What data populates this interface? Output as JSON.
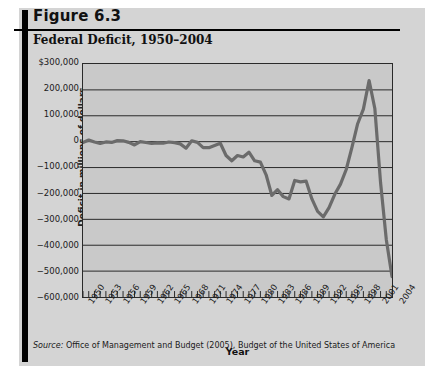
{
  "figure": {
    "label": "Figure 6.3",
    "title": "Federal Deficit, 1950–2004",
    "source_prefix": "Source:",
    "source_text": " Office of Management and Budget (2005), Budget of the United States of America"
  },
  "colors": {
    "panel_background": "#d4d4d4",
    "plot_background": "#c9c9c9",
    "line": "#6b6b6b",
    "axis": "#2a2a2a",
    "grid": "#2a2a2a",
    "text": "#1a1a1a",
    "bar": "#000000"
  },
  "chart_data": {
    "type": "line",
    "title": "Federal Deficit, 1950–2004",
    "xlabel": "Year",
    "ylabel": "Deficit in millions of dollars",
    "ylim": [
      -600000,
      300000
    ],
    "xlim": [
      1950,
      2004
    ],
    "grid": true,
    "legend": "none",
    "ytick_labels": [
      "$300,000",
      "200,000",
      "100,000",
      "0",
      "−100,000",
      "−200,000",
      "−300,000",
      "−400,000",
      "−500,000",
      "−600,000"
    ],
    "ytick_values": [
      300000,
      200000,
      100000,
      0,
      -100000,
      -200000,
      -300000,
      -400000,
      -500000,
      -600000
    ],
    "xtick_labels": [
      "1950",
      "1953",
      "1956",
      "1959",
      "1962",
      "1965",
      "1968",
      "1971",
      "1974",
      "1977",
      "1980",
      "1983",
      "1986",
      "1989",
      "1992",
      "1995",
      "1998",
      "2001",
      "2004"
    ],
    "xtick_values": [
      1950,
      1953,
      1956,
      1959,
      1962,
      1965,
      1968,
      1971,
      1974,
      1977,
      1980,
      1983,
      1986,
      1989,
      1992,
      1995,
      1998,
      2001,
      2004
    ],
    "series": [
      {
        "name": "Federal surplus or deficit",
        "x": [
          1950,
          1951,
          1952,
          1953,
          1954,
          1955,
          1956,
          1957,
          1958,
          1959,
          1960,
          1961,
          1962,
          1963,
          1964,
          1965,
          1966,
          1967,
          1968,
          1969,
          1970,
          1971,
          1972,
          1973,
          1974,
          1975,
          1976,
          1977,
          1978,
          1979,
          1980,
          1981,
          1982,
          1983,
          1984,
          1985,
          1986,
          1987,
          1988,
          1989,
          1990,
          1991,
          1992,
          1993,
          1994,
          1995,
          1996,
          1997,
          1998,
          1999,
          2000,
          2001,
          2002,
          2003,
          2004
        ],
        "values": [
          -3119,
          6102,
          -1519,
          -6493,
          -1154,
          -2993,
          3947,
          3412,
          -2769,
          -12849,
          301,
          -3335,
          -7146,
          -4756,
          -5915,
          -1411,
          -3698,
          -8643,
          -25161,
          3242,
          -2842,
          -23033,
          -23373,
          -14908,
          -6135,
          -53242,
          -73732,
          -53659,
          -59186,
          -40726,
          -73830,
          -78968,
          -127977,
          -207802,
          -185367,
          -212308,
          -221227,
          -149730,
          -155178,
          -152639,
          -221036,
          -269238,
          -290321,
          -255051,
          -203186,
          -163952,
          -107431,
          -21884,
          69270,
          125610,
          236241,
          128236,
          -157758,
          -377585,
          -521000
        ]
      }
    ]
  }
}
